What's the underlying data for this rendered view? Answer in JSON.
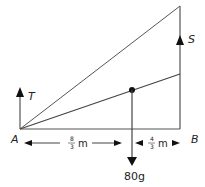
{
  "diagram": {
    "points": {
      "A": {
        "label": "A"
      },
      "B": {
        "label": "B"
      }
    },
    "forces": {
      "T": {
        "label": "T",
        "direction": "up",
        "at": "A"
      },
      "S": {
        "label": "S",
        "direction": "up",
        "at": "B"
      },
      "W": {
        "label": "80g",
        "direction": "down",
        "at": "center-of-mass"
      }
    },
    "dimensions": {
      "left": {
        "numerator": "8",
        "denominator": "3",
        "unit": "m"
      },
      "right": {
        "numerator": "4",
        "denominator": "3",
        "unit": "m"
      }
    },
    "colors": {
      "line": "#555555",
      "arrow": "#111111",
      "text": "#222222"
    }
  }
}
